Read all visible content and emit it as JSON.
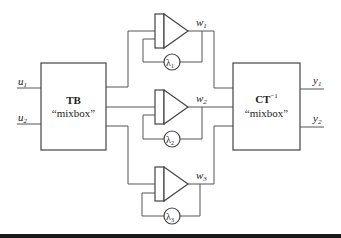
{
  "diagram": {
    "inputs": [
      {
        "name": "u",
        "sub": "1"
      },
      {
        "name": "u",
        "sub": "2"
      }
    ],
    "left_box": {
      "title": "TB",
      "subtitle": "“mixbox”"
    },
    "right_box": {
      "title": "CT",
      "title_sup": "−1",
      "subtitle": "“mixbox”"
    },
    "channels": [
      {
        "output": "w",
        "output_sub": "1",
        "gain": "λ",
        "gain_sub": "1"
      },
      {
        "output": "w",
        "output_sub": "2",
        "gain": "λ",
        "gain_sub": "2"
      },
      {
        "output": "w",
        "output_sub": "3",
        "gain": "λ",
        "gain_sub": "3"
      }
    ],
    "outputs": [
      {
        "name": "y",
        "sub": "1"
      },
      {
        "name": "y",
        "sub": "2"
      }
    ],
    "icons": {
      "amplifier": "amplifier-triangle-icon",
      "gain": "gain-circle-icon"
    }
  }
}
